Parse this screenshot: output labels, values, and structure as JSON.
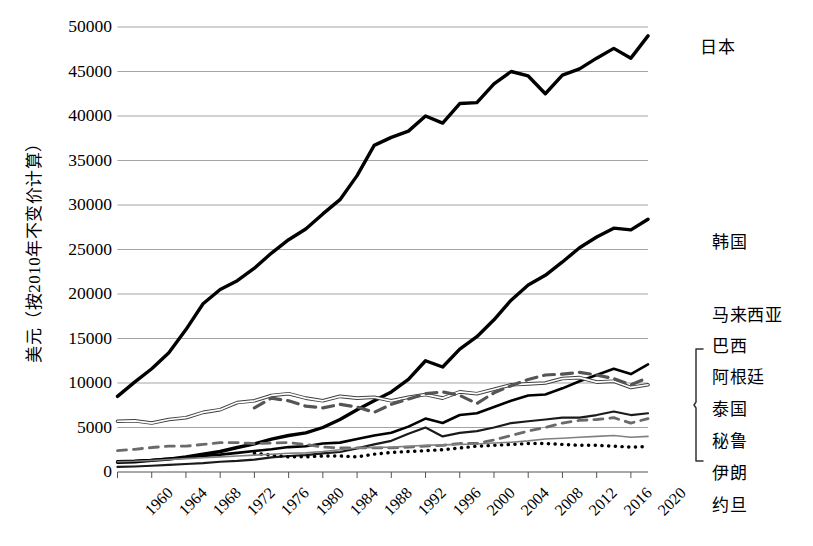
{
  "chart_data": {
    "type": "line",
    "title": "",
    "xlabel": "",
    "ylabel": "美元（按2010年不变价计算）",
    "xlim": [
      1960,
      2022
    ],
    "ylim": [
      0,
      50000
    ],
    "grid": true,
    "legend_position": "right-inline",
    "x_ticks": [
      "1960",
      "1964",
      "1968",
      "1972",
      "1976",
      "1980",
      "1984",
      "1988",
      "1992",
      "1996",
      "2000",
      "2004",
      "2008",
      "2012",
      "2016",
      "2020"
    ],
    "y_ticks": [
      "0",
      "5000",
      "10000",
      "15000",
      "20000",
      "25000",
      "30000",
      "35000",
      "40000",
      "45000",
      "50000"
    ],
    "x": [
      1960,
      1962,
      1964,
      1966,
      1968,
      1970,
      1972,
      1974,
      1976,
      1978,
      1980,
      1982,
      1984,
      1986,
      1988,
      1990,
      1992,
      1994,
      1996,
      1998,
      2000,
      2002,
      2004,
      2006,
      2008,
      2010,
      2012,
      2014,
      2016,
      2018,
      2020,
      2022
    ],
    "series": [
      {
        "name": "日本",
        "label": "日本",
        "style": "solid-thick",
        "color": "#000000",
        "start_year": 1960,
        "values": [
          8500,
          10100,
          11600,
          13400,
          16000,
          18900,
          20500,
          21500,
          22900,
          24600,
          26100,
          27300,
          29000,
          30600,
          33300,
          36700,
          37600,
          38300,
          40000,
          39200,
          41400,
          41500,
          43600,
          45000,
          44500,
          42500,
          44600,
          45300,
          46500,
          47600,
          46500,
          49000
        ]
      },
      {
        "name": "韩国",
        "label": "韩国",
        "style": "solid-thick",
        "color": "#000000",
        "start_year": 1960,
        "values": [
          1100,
          1150,
          1300,
          1450,
          1700,
          2000,
          2300,
          2750,
          3150,
          3700,
          4100,
          4400,
          5000,
          5900,
          7000,
          8000,
          9000,
          10400,
          12500,
          11800,
          13800,
          15200,
          17100,
          19300,
          21000,
          22100,
          23600,
          25200,
          26400,
          27400,
          27200,
          28400
        ]
      },
      {
        "name": "马来西亚",
        "label": "马来西亚",
        "style": "solid-medium",
        "color": "#000000",
        "start_year": 1960,
        "values": [
          1200,
          1250,
          1350,
          1500,
          1600,
          1800,
          1950,
          2150,
          2350,
          2550,
          2800,
          2900,
          3200,
          3300,
          3700,
          4100,
          4400,
          5100,
          6000,
          5500,
          6400,
          6600,
          7300,
          8000,
          8600,
          8700,
          9400,
          10200,
          10900,
          11600,
          11000,
          12100
        ]
      },
      {
        "name": "巴西",
        "label": "巴西",
        "style": "double-line",
        "color": "#3f3f3f",
        "start_year": 1960,
        "values": [
          5700,
          5750,
          5500,
          5900,
          6100,
          6700,
          7000,
          7800,
          8000,
          8600,
          8800,
          8300,
          8000,
          8500,
          8300,
          8400,
          8000,
          8400,
          8700,
          8300,
          9000,
          8800,
          9300,
          9800,
          9900,
          10000,
          10500,
          10600,
          10100,
          10200,
          9500,
          9800
        ]
      },
      {
        "name": "阿根廷",
        "label": "阿根廷",
        "style": "dashed",
        "color": "#555555",
        "start_year": 1976,
        "values": [
          null,
          null,
          null,
          null,
          null,
          null,
          null,
          null,
          7200,
          8300,
          8000,
          7400,
          7200,
          7600,
          7300,
          6700,
          7600,
          8200,
          8800,
          9000,
          8600,
          7700,
          8900,
          9700,
          10400,
          10900,
          11000,
          11200,
          10900,
          10500,
          9800,
          10600
        ]
      },
      {
        "name": "泰国",
        "label": "泰国",
        "style": "solid-thin-dark",
        "color": "#1a1a1a",
        "start_year": 1960,
        "values": [
          570,
          620,
          700,
          790,
          900,
          1000,
          1150,
          1250,
          1400,
          1650,
          1800,
          1900,
          2100,
          2250,
          2650,
          3100,
          3500,
          4300,
          5000,
          4000,
          4400,
          4600,
          5000,
          5500,
          5700,
          5900,
          6100,
          6100,
          6400,
          6800,
          6400,
          6600
        ]
      },
      {
        "name": "秘鲁",
        "label": "秘鲁",
        "style": "dashed-thin",
        "color": "#6a6a6a",
        "start_year": 1960,
        "values": [
          2400,
          2550,
          2750,
          2900,
          2900,
          3100,
          3300,
          3300,
          3200,
          3250,
          3300,
          3100,
          2800,
          2700,
          2700,
          2700,
          2700,
          2800,
          2900,
          3000,
          3200,
          3200,
          3600,
          4100,
          4600,
          5000,
          5500,
          5800,
          5900,
          6100,
          5500,
          6000
        ]
      },
      {
        "name": "伊朗",
        "label": "伊朗",
        "style": "dotted",
        "color": "#000000",
        "start_year": 1976,
        "values": [
          null,
          null,
          null,
          null,
          null,
          null,
          null,
          null,
          2100,
          1900,
          1700,
          1700,
          1800,
          1800,
          1700,
          2000,
          2200,
          2300,
          2400,
          2500,
          2700,
          2900,
          3000,
          3100,
          3200,
          3200,
          3100,
          3000,
          3000,
          2900,
          2800,
          2850
        ]
      },
      {
        "name": "约旦",
        "label": "约旦",
        "style": "solid-thin-gray",
        "color": "#808080",
        "start_year": 1960,
        "values": [
          1150,
          1200,
          1300,
          1400,
          1500,
          1600,
          1700,
          1800,
          1900,
          2000,
          2100,
          2150,
          2300,
          2500,
          2700,
          2750,
          2800,
          2900,
          3000,
          3050,
          3100,
          3150,
          3250,
          3350,
          3500,
          3700,
          3800,
          3900,
          4000,
          4100,
          3900,
          4000
        ]
      }
    ],
    "legend_bracket_group": [
      "阿根廷",
      "泰国",
      "秘鲁",
      "伊朗"
    ]
  },
  "legend": [
    {
      "label": "日本",
      "x": 700,
      "y": 33
    },
    {
      "label": "韩国",
      "x": 712,
      "y": 228
    },
    {
      "label": "马来西亚",
      "x": 712,
      "y": 301
    },
    {
      "label": "巴西",
      "x": 712,
      "y": 332
    },
    {
      "label": "阿根廷",
      "x": 712,
      "y": 363
    },
    {
      "label": "泰国",
      "x": 712,
      "y": 395
    },
    {
      "label": "秘鲁",
      "x": 712,
      "y": 427
    },
    {
      "label": "伊朗",
      "x": 712,
      "y": 459
    },
    {
      "label": "约旦",
      "x": 712,
      "y": 491
    }
  ]
}
